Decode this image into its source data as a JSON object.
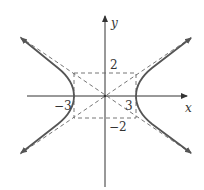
{
  "diagram": {
    "type": "hyperbola",
    "equation": "x^2/9 - y^2/4 = 1",
    "a": 3,
    "b": 2,
    "axes": {
      "x_label": "x",
      "y_label": "y"
    },
    "tick_labels": {
      "x_pos": "3",
      "x_neg": "−3",
      "y_pos": "2",
      "y_neg": "−2"
    },
    "features": [
      "asymptotes (dashed)",
      "central rectangle (dashed)",
      "two branches with arrows"
    ],
    "colors": {
      "curve": "#555555",
      "dashed": "#666666",
      "axis": "#333333"
    }
  }
}
